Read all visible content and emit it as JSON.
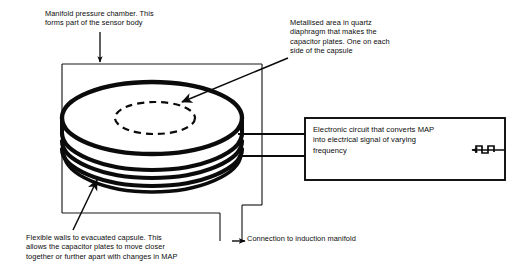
{
  "diagram": {
    "colors": {
      "ink": "#0b0b0b",
      "background": "#ffffff",
      "line": "#1a1a1a"
    },
    "labels": {
      "manifold_chamber": "Manifold pressure chamber. This\nforms part of the sensor body",
      "metallised_area": "Metallised area in quartz\ndiaphragm that makes the\ncapacitor plates. One on each\nside of the capsule",
      "flexible_walls": "Flexible walls to evacuated capsule. This\nallows the capacitor plates to move closer\ntogether or further apart with changes in MAP",
      "connection_manifold": "Connection to induction manifold",
      "electronic_circuit": "Electronic circuit that converts MAP\ninto electrical signal of varying\nfrequency"
    },
    "parts": {
      "chamber_box": "manifold-pressure-chamber",
      "capsule": "evacuated-capacitive-capsule",
      "capsule_plate": "metallised-capacitor-plate-dashed-ellipse",
      "bellows_ridges": 3,
      "wires": 2,
      "circuit_box": "electronic-circuit",
      "output_symbol": "square-wave-frequency-output",
      "manifold_tube": "induction-manifold-connection-tube"
    }
  }
}
